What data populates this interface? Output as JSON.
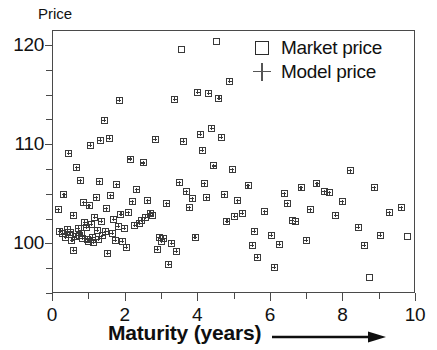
{
  "chart_data": {
    "type": "scatter",
    "title": "",
    "xlabel": "Maturity (years)",
    "ylabel": "Price",
    "xlim": [
      0,
      10
    ],
    "ylim": [
      95,
      121.5
    ],
    "grid": false,
    "legend_position": "top-right",
    "x_ticks": [
      0,
      2,
      4,
      6,
      8,
      10
    ],
    "x_tick_labels": [
      "0",
      "2",
      "4",
      "6",
      "8",
      "10"
    ],
    "x_minor_step": 1,
    "y_ticks": [
      100,
      110,
      120
    ],
    "y_tick_labels": [
      "100",
      "110",
      "120"
    ],
    "y_minor_step": 2.5,
    "series": [
      {
        "name": "Market price",
        "marker": "square",
        "color": "#3a3a3a"
      },
      {
        "name": "Model price",
        "marker": "plus",
        "color": "#555555"
      }
    ],
    "points": [
      {
        "x": 0.18,
        "y": 103.4,
        "model": true
      },
      {
        "x": 0.22,
        "y": 101.2,
        "model": true
      },
      {
        "x": 0.3,
        "y": 101.0,
        "model": true
      },
      {
        "x": 0.33,
        "y": 104.9,
        "model": true
      },
      {
        "x": 0.38,
        "y": 100.6,
        "model": true
      },
      {
        "x": 0.42,
        "y": 101.4,
        "model": true
      },
      {
        "x": 0.46,
        "y": 109.1,
        "model": true
      },
      {
        "x": 0.48,
        "y": 100.9,
        "model": true
      },
      {
        "x": 0.52,
        "y": 101.1,
        "model": true
      },
      {
        "x": 0.55,
        "y": 100.3,
        "model": true
      },
      {
        "x": 0.58,
        "y": 102.8,
        "model": true
      },
      {
        "x": 0.6,
        "y": 99.3,
        "model": true
      },
      {
        "x": 0.64,
        "y": 100.7,
        "model": true
      },
      {
        "x": 0.68,
        "y": 107.6,
        "model": true
      },
      {
        "x": 0.72,
        "y": 101.5,
        "model": true
      },
      {
        "x": 0.75,
        "y": 100.8,
        "model": true
      },
      {
        "x": 0.78,
        "y": 106.3,
        "model": true
      },
      {
        "x": 0.8,
        "y": 101.0,
        "model": true
      },
      {
        "x": 0.84,
        "y": 100.5,
        "model": true
      },
      {
        "x": 0.88,
        "y": 104.1,
        "model": true
      },
      {
        "x": 0.9,
        "y": 102.1,
        "model": true
      },
      {
        "x": 0.94,
        "y": 101.6,
        "model": true
      },
      {
        "x": 0.97,
        "y": 100.4,
        "model": true
      },
      {
        "x": 1.0,
        "y": 100.2,
        "model": true
      },
      {
        "x": 1.02,
        "y": 103.8,
        "model": true
      },
      {
        "x": 1.05,
        "y": 109.9,
        "model": true
      },
      {
        "x": 1.08,
        "y": 101.9,
        "model": true
      },
      {
        "x": 1.12,
        "y": 100.6,
        "model": true
      },
      {
        "x": 1.15,
        "y": 100.1,
        "model": true
      },
      {
        "x": 1.18,
        "y": 102.6,
        "model": true
      },
      {
        "x": 1.22,
        "y": 104.6,
        "model": true
      },
      {
        "x": 1.25,
        "y": 101.3,
        "model": true
      },
      {
        "x": 1.28,
        "y": 100.4,
        "model": true
      },
      {
        "x": 1.3,
        "y": 106.2,
        "model": true
      },
      {
        "x": 1.33,
        "y": 110.4,
        "model": true
      },
      {
        "x": 1.36,
        "y": 102.2,
        "model": true
      },
      {
        "x": 1.4,
        "y": 100.8,
        "model": true
      },
      {
        "x": 1.44,
        "y": 112.4,
        "model": true
      },
      {
        "x": 1.48,
        "y": 101.2,
        "model": true
      },
      {
        "x": 1.5,
        "y": 103.5,
        "model": true
      },
      {
        "x": 1.54,
        "y": 99.0,
        "model": true
      },
      {
        "x": 1.58,
        "y": 110.6,
        "model": true
      },
      {
        "x": 1.62,
        "y": 104.8,
        "model": true
      },
      {
        "x": 1.66,
        "y": 101.0,
        "model": true
      },
      {
        "x": 1.7,
        "y": 102.4,
        "model": true
      },
      {
        "x": 1.74,
        "y": 100.3,
        "model": true
      },
      {
        "x": 1.78,
        "y": 105.9,
        "model": true
      },
      {
        "x": 1.82,
        "y": 101.7,
        "model": true
      },
      {
        "x": 1.86,
        "y": 114.4,
        "model": true
      },
      {
        "x": 1.9,
        "y": 102.9,
        "model": true
      },
      {
        "x": 1.94,
        "y": 100.2,
        "model": true
      },
      {
        "x": 2.0,
        "y": 101.5,
        "model": true
      },
      {
        "x": 2.05,
        "y": 99.6,
        "model": true
      },
      {
        "x": 2.1,
        "y": 103.1,
        "model": true
      },
      {
        "x": 2.16,
        "y": 108.5,
        "model": true
      },
      {
        "x": 2.22,
        "y": 104.2,
        "model": true
      },
      {
        "x": 2.28,
        "y": 101.8,
        "model": true
      },
      {
        "x": 2.34,
        "y": 105.4,
        "model": true
      },
      {
        "x": 2.4,
        "y": 102.0,
        "model": true
      },
      {
        "x": 2.46,
        "y": 102.3,
        "model": true
      },
      {
        "x": 2.52,
        "y": 108.1,
        "model": true
      },
      {
        "x": 2.58,
        "y": 102.6,
        "model": true
      },
      {
        "x": 2.64,
        "y": 104.3,
        "model": true
      },
      {
        "x": 2.7,
        "y": 103.0,
        "model": true
      },
      {
        "x": 2.76,
        "y": 102.8,
        "model": true
      },
      {
        "x": 2.84,
        "y": 110.5,
        "model": true
      },
      {
        "x": 2.9,
        "y": 99.4,
        "model": true
      },
      {
        "x": 2.96,
        "y": 100.6,
        "model": true
      },
      {
        "x": 3.02,
        "y": 100.2,
        "model": true
      },
      {
        "x": 3.08,
        "y": 100.5,
        "model": true
      },
      {
        "x": 3.16,
        "y": 104.0,
        "model": true
      },
      {
        "x": 3.22,
        "y": 97.9,
        "model": true
      },
      {
        "x": 3.3,
        "y": 100.0,
        "model": true
      },
      {
        "x": 3.38,
        "y": 114.5,
        "model": true
      },
      {
        "x": 3.42,
        "y": 99.2,
        "model": true
      },
      {
        "x": 3.5,
        "y": 106.1,
        "model": true
      },
      {
        "x": 3.56,
        "y": 119.5,
        "model": false
      },
      {
        "x": 3.62,
        "y": 110.3,
        "model": true
      },
      {
        "x": 3.7,
        "y": 105.2,
        "model": true
      },
      {
        "x": 3.78,
        "y": 103.6,
        "model": true
      },
      {
        "x": 3.86,
        "y": 104.5,
        "model": true
      },
      {
        "x": 3.94,
        "y": 100.6,
        "model": true
      },
      {
        "x": 4.02,
        "y": 115.2,
        "model": true
      },
      {
        "x": 4.08,
        "y": 111.0,
        "model": true
      },
      {
        "x": 4.14,
        "y": 109.4,
        "model": true
      },
      {
        "x": 4.2,
        "y": 106.0,
        "model": true
      },
      {
        "x": 4.26,
        "y": 104.6,
        "model": true
      },
      {
        "x": 4.32,
        "y": 115.1,
        "model": true
      },
      {
        "x": 4.4,
        "y": 111.6,
        "model": true
      },
      {
        "x": 4.46,
        "y": 107.8,
        "model": true
      },
      {
        "x": 4.54,
        "y": 120.3,
        "model": false
      },
      {
        "x": 4.6,
        "y": 114.6,
        "model": true
      },
      {
        "x": 4.66,
        "y": 110.7,
        "model": true
      },
      {
        "x": 4.74,
        "y": 104.9,
        "model": true
      },
      {
        "x": 4.82,
        "y": 102.2,
        "model": true
      },
      {
        "x": 4.9,
        "y": 116.3,
        "model": true
      },
      {
        "x": 4.96,
        "y": 107.4,
        "model": true
      },
      {
        "x": 5.04,
        "y": 102.7,
        "model": true
      },
      {
        "x": 5.12,
        "y": 104.3,
        "model": true
      },
      {
        "x": 5.24,
        "y": 103.0,
        "model": true
      },
      {
        "x": 5.4,
        "y": 105.8,
        "model": true
      },
      {
        "x": 5.52,
        "y": 99.8,
        "model": true
      },
      {
        "x": 5.58,
        "y": 101.2,
        "model": true
      },
      {
        "x": 5.66,
        "y": 98.6,
        "model": true
      },
      {
        "x": 5.86,
        "y": 103.2,
        "model": true
      },
      {
        "x": 6.04,
        "y": 100.8,
        "model": true
      },
      {
        "x": 6.12,
        "y": 97.6,
        "model": true
      },
      {
        "x": 6.26,
        "y": 99.9,
        "model": true
      },
      {
        "x": 6.4,
        "y": 105.0,
        "model": true
      },
      {
        "x": 6.48,
        "y": 104.0,
        "model": true
      },
      {
        "x": 6.62,
        "y": 102.3,
        "model": true
      },
      {
        "x": 6.72,
        "y": 102.2,
        "model": true
      },
      {
        "x": 6.86,
        "y": 105.6,
        "model": true
      },
      {
        "x": 7.0,
        "y": 100.3,
        "model": true
      },
      {
        "x": 7.12,
        "y": 103.4,
        "model": true
      },
      {
        "x": 7.3,
        "y": 106.0,
        "model": true
      },
      {
        "x": 7.5,
        "y": 105.2,
        "model": true
      },
      {
        "x": 7.64,
        "y": 105.1,
        "model": true
      },
      {
        "x": 7.82,
        "y": 102.8,
        "model": true
      },
      {
        "x": 8.0,
        "y": 104.2,
        "model": true
      },
      {
        "x": 8.22,
        "y": 107.3,
        "model": true
      },
      {
        "x": 8.44,
        "y": 101.6,
        "model": true
      },
      {
        "x": 8.6,
        "y": 99.8,
        "model": true
      },
      {
        "x": 8.74,
        "y": 96.6,
        "model": false
      },
      {
        "x": 8.88,
        "y": 105.6,
        "model": true
      },
      {
        "x": 9.04,
        "y": 100.8,
        "model": true
      },
      {
        "x": 9.3,
        "y": 103.1,
        "model": true
      },
      {
        "x": 9.62,
        "y": 103.6,
        "model": true
      },
      {
        "x": 9.8,
        "y": 100.7,
        "model": false
      }
    ]
  },
  "legend": {
    "items": [
      {
        "label": "Market price",
        "symbol": "square"
      },
      {
        "label": "Model price",
        "symbol": "plus"
      }
    ]
  },
  "axes": {
    "y_title": "Price",
    "x_title": "Maturity (years)"
  }
}
